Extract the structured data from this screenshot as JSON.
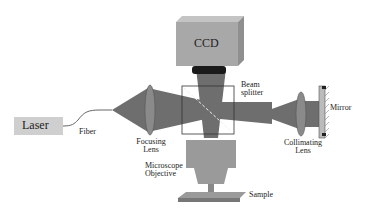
{
  "diagram": {
    "components": {
      "laser": "Laser",
      "fiber": "Fiber",
      "focusing_lens": [
        "Focusing",
        "Lens"
      ],
      "ccd": "CCD",
      "beam_splitter": [
        "Beam",
        "splitter"
      ],
      "collimating_lens": [
        "Collimating",
        "Lens"
      ],
      "mirror": "Mirror",
      "microscope_objective": [
        "Microscope",
        "Objective"
      ],
      "sample": "Sample"
    },
    "colors": {
      "beam": "#6e6e6e",
      "component_fill": "#9a9a9a",
      "ccd_fill": "#a8a8a8",
      "laser_fill": "#cfcfcf",
      "lens_fill": "#8a8a8a"
    }
  }
}
